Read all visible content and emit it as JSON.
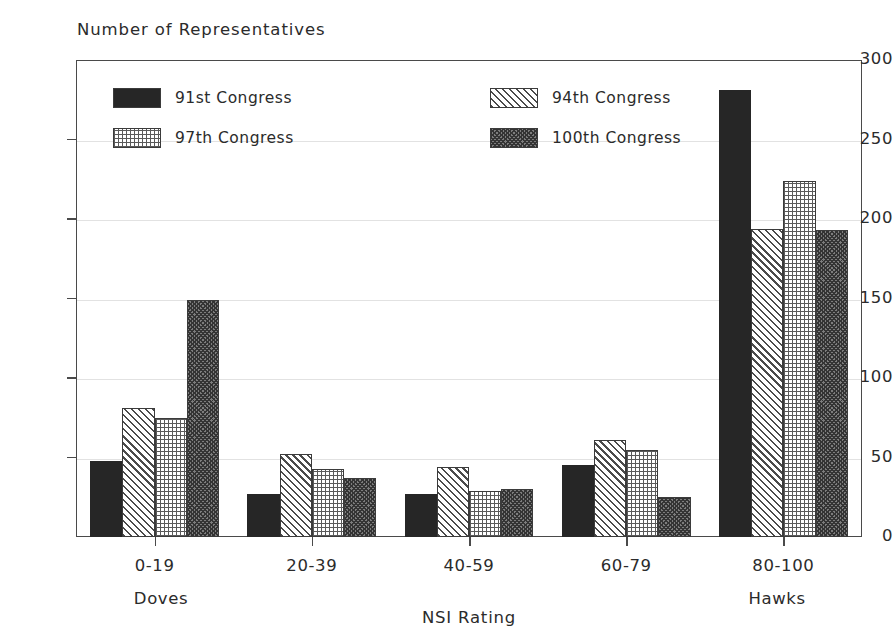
{
  "chart_data": {
    "type": "bar",
    "title": "",
    "ylabel": "Number of Representatives",
    "xlabel": "NSI Rating",
    "ylim": [
      0,
      300
    ],
    "yticks": [
      0,
      50,
      100,
      150,
      200,
      250,
      300
    ],
    "ytick_labels": [
      "0",
      "50",
      "100",
      "150",
      "200",
      "250",
      "300"
    ],
    "grid": true,
    "legend_position": "inside-top-left",
    "categories": [
      "0-19",
      "20-39",
      "40-59",
      "60-79",
      "80-100"
    ],
    "axis_end_labels": {
      "left": "Doves",
      "right": "Hawks"
    },
    "series": [
      {
        "name": "91st Congress",
        "pattern": "solid",
        "values": [
          48,
          27,
          27,
          45,
          281
        ]
      },
      {
        "name": "94th Congress",
        "pattern": "diagonal-hatch",
        "values": [
          81,
          52,
          44,
          61,
          194
        ]
      },
      {
        "name": "97th Congress",
        "pattern": "fine-grid",
        "values": [
          75,
          43,
          29,
          55,
          224
        ]
      },
      {
        "name": "100th Congress",
        "pattern": "dense-crosshatch",
        "values": [
          149,
          37,
          30,
          25,
          193
        ]
      }
    ]
  },
  "colors": {
    "axis": "#4a4a4a",
    "grid": "#e2e2e2",
    "text": "#2b2b2b",
    "background": "#ffffff",
    "series_solid": "#262626",
    "series_dense": "#7d7d7d"
  }
}
